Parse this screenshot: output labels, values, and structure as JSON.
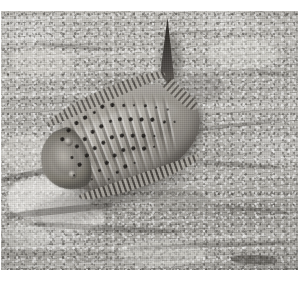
{
  "image": {
    "kind": "photograph",
    "subject": "fossil-arthropod-trilobite-in-rock-matrix",
    "orientation": "landscape",
    "color_mode": "grayscale",
    "caption": "",
    "frame": {
      "page_background": "#ffffff",
      "plate_left": 1,
      "plate_top": 11,
      "plate_width": 297,
      "plate_height": 259
    },
    "palette": {
      "page_white": "#ffffff",
      "rock_light": "#c9c7c2",
      "rock_mid": "#b2b0ab",
      "rock_dark": "#9e9c97",
      "rock_crevice": "#2e2b27",
      "fossil_light": "#b5b1a9",
      "fossil_mid": "#95918a",
      "fossil_dark": "#6f6b66",
      "tubercle": "#221f1c",
      "tail_spine": "#2b2825"
    },
    "subject_region": {
      "label": "fossil",
      "left": 34,
      "top": 66,
      "width": 178,
      "height": 122,
      "rotation_deg": -21
    },
    "features": {
      "cephalon_label": "head shield",
      "axial_lobe_label": "axial lobe",
      "tail_spine_label": "tail spine",
      "fringe_label": "marginal spine fringe",
      "tubercle_label": "tubercle pits",
      "rib_count": 13,
      "tubercle_count": 46
    }
  },
  "rock": {
    "cracks": [
      {
        "left": 4,
        "top": 196,
        "width": 110,
        "height": 7,
        "rot": -6,
        "opacity": 0.55
      },
      {
        "left": 28,
        "top": 214,
        "width": 150,
        "height": 6,
        "rot": 3,
        "opacity": 0.45
      },
      {
        "left": 126,
        "top": 232,
        "width": 160,
        "height": 5,
        "rot": -2,
        "opacity": 0.4
      },
      {
        "left": 160,
        "top": 150,
        "width": 120,
        "height": 5,
        "rot": 4,
        "opacity": 0.42
      },
      {
        "left": 188,
        "top": 112,
        "width": 96,
        "height": 4,
        "rot": -7,
        "opacity": 0.38
      },
      {
        "left": 36,
        "top": 34,
        "width": 78,
        "height": 4,
        "rot": 5,
        "opacity": 0.3
      },
      {
        "left": 150,
        "top": 20,
        "width": 66,
        "height": 3,
        "rot": -3,
        "opacity": 0.26
      },
      {
        "left": 0,
        "top": 160,
        "width": 58,
        "height": 6,
        "rot": -12,
        "opacity": 0.5
      },
      {
        "left": 206,
        "top": 196,
        "width": 86,
        "height": 4,
        "rot": 6,
        "opacity": 0.34
      },
      {
        "left": 64,
        "top": 246,
        "width": 130,
        "height": 5,
        "rot": -1,
        "opacity": 0.3
      },
      {
        "left": 230,
        "top": 244,
        "width": 46,
        "height": 9,
        "rot": 2,
        "opacity": 0.8
      },
      {
        "left": 246,
        "top": 60,
        "width": 44,
        "height": 4,
        "rot": 10,
        "opacity": 0.28
      }
    ],
    "chips": [
      {
        "left": 6,
        "top": 166,
        "width": 84,
        "height": 44,
        "fill": "rgba(246,244,240,0.62)"
      },
      {
        "left": 40,
        "top": 190,
        "width": 64,
        "height": 30,
        "fill": "rgba(250,248,244,0.52)"
      },
      {
        "left": 0,
        "top": 124,
        "width": 52,
        "height": 36,
        "fill": "rgba(240,238,233,0.42)"
      },
      {
        "left": 2,
        "top": 212,
        "width": 46,
        "height": 26,
        "fill": "rgba(236,234,229,0.40)"
      },
      {
        "left": 208,
        "top": 28,
        "width": 70,
        "height": 30,
        "fill": "rgba(244,242,238,0.34)"
      },
      {
        "left": 118,
        "top": 230,
        "width": 88,
        "height": 24,
        "fill": "rgba(242,240,235,0.36)"
      },
      {
        "left": 10,
        "top": 36,
        "width": 62,
        "height": 28,
        "fill": "rgba(238,236,231,0.32)"
      },
      {
        "left": 150,
        "top": 178,
        "width": 58,
        "height": 22,
        "fill": "rgba(120,116,110,0.30)"
      },
      {
        "left": 176,
        "top": 64,
        "width": 48,
        "height": 26,
        "fill": "rgba(110,106,100,0.26)"
      }
    ]
  },
  "fossil": {
    "ribs": [
      {
        "left": 26,
        "rot": -4,
        "h": 84
      },
      {
        "left": 35,
        "rot": -3,
        "h": 88
      },
      {
        "left": 44,
        "rot": -2,
        "h": 92
      },
      {
        "left": 53,
        "rot": -1,
        "h": 94
      },
      {
        "left": 62,
        "rot": 0,
        "h": 94
      },
      {
        "left": 71,
        "rot": 1,
        "h": 94
      },
      {
        "left": 80,
        "rot": 2,
        "h": 92
      },
      {
        "left": 89,
        "rot": 3,
        "h": 90
      },
      {
        "left": 98,
        "rot": 4,
        "h": 86
      },
      {
        "left": 107,
        "rot": 5,
        "h": 82
      },
      {
        "left": 116,
        "rot": 6,
        "h": 76
      },
      {
        "left": 125,
        "rot": 8,
        "h": 68
      },
      {
        "left": 134,
        "rot": 10,
        "h": 58
      }
    ],
    "pits": [
      {
        "x": 31,
        "y": 40,
        "d": 3.5
      },
      {
        "x": 33,
        "y": 60,
        "d": 3.0
      },
      {
        "x": 29,
        "y": 78,
        "d": 2.6
      },
      {
        "x": 40,
        "y": 34,
        "d": 3.6
      },
      {
        "x": 42,
        "y": 52,
        "d": 4.2
      },
      {
        "x": 38,
        "y": 70,
        "d": 3.2
      },
      {
        "x": 44,
        "y": 88,
        "d": 2.8
      },
      {
        "x": 50,
        "y": 30,
        "d": 3.4
      },
      {
        "x": 52,
        "y": 48,
        "d": 4.0
      },
      {
        "x": 48,
        "y": 64,
        "d": 3.6
      },
      {
        "x": 54,
        "y": 82,
        "d": 3.0
      },
      {
        "x": 60,
        "y": 28,
        "d": 3.2
      },
      {
        "x": 62,
        "y": 44,
        "d": 3.8
      },
      {
        "x": 58,
        "y": 60,
        "d": 4.4
      },
      {
        "x": 64,
        "y": 78,
        "d": 3.4
      },
      {
        "x": 60,
        "y": 94,
        "d": 2.6
      },
      {
        "x": 70,
        "y": 26,
        "d": 3.0
      },
      {
        "x": 72,
        "y": 42,
        "d": 3.6
      },
      {
        "x": 68,
        "y": 58,
        "d": 4.0
      },
      {
        "x": 74,
        "y": 74,
        "d": 3.8
      },
      {
        "x": 70,
        "y": 90,
        "d": 3.0
      },
      {
        "x": 80,
        "y": 24,
        "d": 3.4
      },
      {
        "x": 82,
        "y": 40,
        "d": 3.0
      },
      {
        "x": 78,
        "y": 56,
        "d": 3.6
      },
      {
        "x": 84,
        "y": 72,
        "d": 4.2
      },
      {
        "x": 80,
        "y": 88,
        "d": 3.2
      },
      {
        "x": 90,
        "y": 26,
        "d": 3.2
      },
      {
        "x": 92,
        "y": 42,
        "d": 3.8
      },
      {
        "x": 88,
        "y": 58,
        "d": 3.4
      },
      {
        "x": 94,
        "y": 74,
        "d": 3.6
      },
      {
        "x": 90,
        "y": 88,
        "d": 2.8
      },
      {
        "x": 100,
        "y": 30,
        "d": 3.0
      },
      {
        "x": 102,
        "y": 46,
        "d": 3.6
      },
      {
        "x": 98,
        "y": 62,
        "d": 4.0
      },
      {
        "x": 104,
        "y": 78,
        "d": 3.2
      },
      {
        "x": 110,
        "y": 34,
        "d": 2.8
      },
      {
        "x": 112,
        "y": 50,
        "d": 3.4
      },
      {
        "x": 108,
        "y": 66,
        "d": 3.6
      },
      {
        "x": 114,
        "y": 80,
        "d": 2.6
      },
      {
        "x": 120,
        "y": 38,
        "d": 3.0
      },
      {
        "x": 122,
        "y": 54,
        "d": 3.2
      },
      {
        "x": 118,
        "y": 70,
        "d": 2.8
      },
      {
        "x": 130,
        "y": 44,
        "d": 2.8
      },
      {
        "x": 132,
        "y": 60,
        "d": 3.0
      },
      {
        "x": 140,
        "y": 50,
        "d": 2.6
      },
      {
        "x": 142,
        "y": 64,
        "d": 2.4
      }
    ]
  }
}
